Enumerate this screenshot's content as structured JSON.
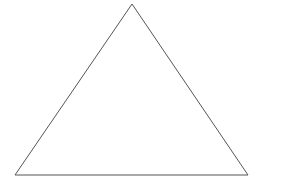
{
  "canvas": {
    "width": 283,
    "height": 183,
    "background_color": "#ffffff"
  },
  "figure": {
    "shape_type": "triangle",
    "stroke_color": "#555555",
    "stroke_width": 1,
    "fill": "none",
    "vertices": [
      {
        "name": "apex",
        "x": 132,
        "y": 4
      },
      {
        "name": "bottom-right",
        "x": 248,
        "y": 175
      },
      {
        "name": "bottom-left",
        "x": 15,
        "y": 175
      }
    ],
    "points_attr": "132,4 248,175 15,175",
    "measurements": {
      "base_width": 233,
      "height": 171,
      "apex_offset_from_base_center": 0.5
    }
  }
}
